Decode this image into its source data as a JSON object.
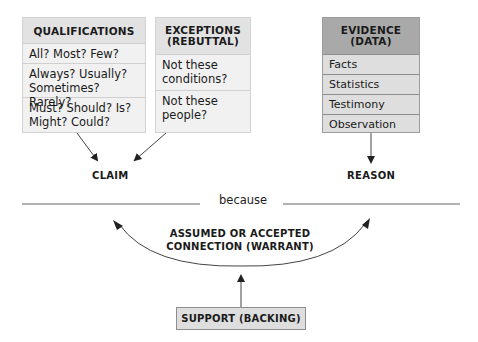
{
  "qualifications": {
    "header": "QUALIFICATIONS",
    "rows": [
      "All? Most? Few?",
      "Always? Usually? Sometimes? Rarely?",
      "Must? Should? Is? Might? Could?"
    ]
  },
  "exceptions": {
    "header": "EXCEPTIONS (REBUTTAL)",
    "rows": [
      "Not these conditions?",
      "Not these people?"
    ]
  },
  "evidence": {
    "header": "EVIDENCE (DATA)",
    "rows": [
      "Facts",
      "Statistics",
      "Testimony",
      "Observation"
    ]
  },
  "claim_label": "CLAIM",
  "reason_label": "REASON",
  "connector_word": "because",
  "warrant_label": "ASSUMED OR ACCEPTED CONNECTION (WARRANT)",
  "support_label": "SUPPORT (BACKING)",
  "colors": {
    "light_box": "#f1f1f1",
    "light_header": "#e2e2e2",
    "dark_box": "#dedede",
    "dark_header": "#a9a9a9",
    "line": "#555555"
  }
}
